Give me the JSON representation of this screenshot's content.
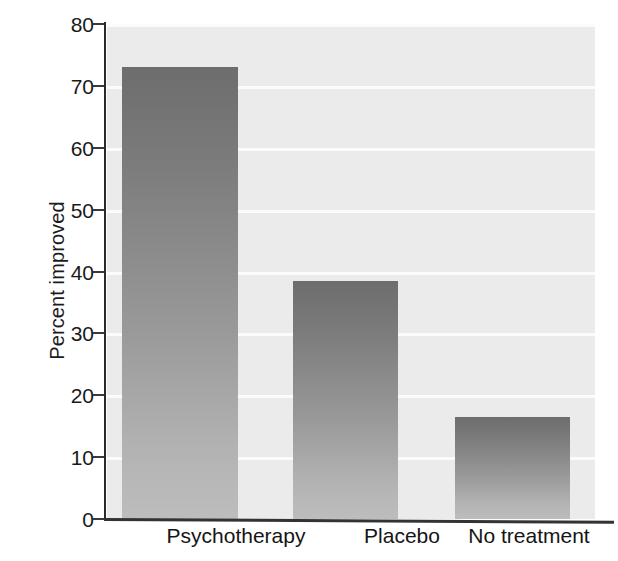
{
  "chart_data": {
    "type": "bar",
    "title": "",
    "xlabel": "",
    "ylabel": "Percent improved",
    "categories": [
      "Psychotherapy",
      "Placebo",
      "No treatment"
    ],
    "values": [
      73,
      38.5,
      16.5
    ],
    "ylim": [
      0,
      80
    ],
    "yticks": [
      0,
      10,
      20,
      30,
      40,
      50,
      60,
      70,
      80
    ],
    "ytick_labels": [
      "0",
      "10",
      "20",
      "30",
      "40",
      "50",
      "60",
      "70",
      "80"
    ],
    "grid": "horizontal-white-gridlines",
    "legend": "none",
    "bar_fill": "vertical-gradient-dark-gray-to-light-gray",
    "plot_background": "#ebebeb",
    "colors": {
      "bar_top": "#6d6d6d",
      "bar_bottom": "#bdbdbd",
      "gridline": "#fbfbfb",
      "axis": "#2a2a2a",
      "text": "#1a1a1a",
      "plot_bg": "#ebebeb",
      "figure_bg": "#ffffff"
    }
  }
}
